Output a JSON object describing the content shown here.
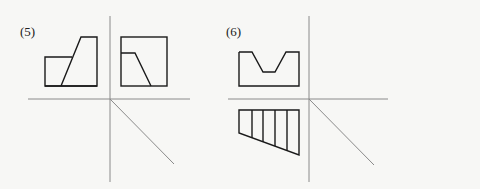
{
  "figures": [
    {
      "label": "(5)",
      "views": [
        "front-view: rectangle with stepped sloped block",
        "side-view: square with sloped notch"
      ],
      "axes": {
        "horizontal_y": 99,
        "vertical_x": 110,
        "diagonal": "45-degree miter line"
      }
    },
    {
      "label": "(6)",
      "views": [
        "front-view: rectangle with trapezoidal V-groove on top",
        "top-view: trapezoid with 4 vertical hatch lines"
      ],
      "axes": {
        "horizontal_y": 99,
        "vertical_x": 309,
        "diagonal": "45-degree miter line"
      }
    }
  ],
  "colors": {
    "line": "#1a1a1a",
    "axis": "#8a8a8a",
    "background": "#f7f7f5"
  }
}
